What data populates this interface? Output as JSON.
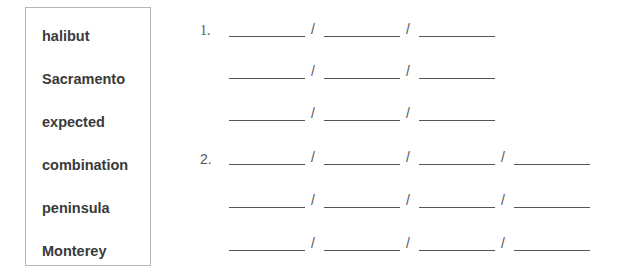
{
  "word_box": {
    "words": [
      "halibut",
      "Sacramento",
      "expected",
      "combination",
      "peninsula",
      "Monterey"
    ]
  },
  "exercises": [
    {
      "number": "1.",
      "rows": 3,
      "blanks_per_row": 3,
      "separator": "/"
    },
    {
      "number": "2.",
      "rows": 3,
      "blanks_per_row": 4,
      "separator": "/"
    }
  ]
}
